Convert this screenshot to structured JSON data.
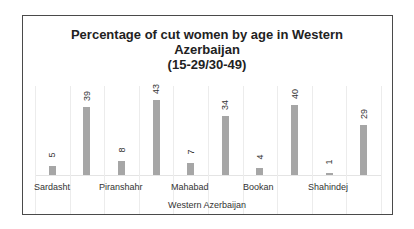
{
  "chart_data": {
    "type": "bar",
    "title": "Percentage of cut women by age in Western Azerbaijan (15-29/30-49)",
    "title_lines": [
      "Percentage of cut women by age in Western",
      "Azerbaijan",
      "(15-29/30-49)"
    ],
    "xlabel": "Western Azerbaijan",
    "ylabel": "",
    "categories": [
      "Sardasht",
      "Piranshahr",
      "Mahabad",
      "Bookan",
      "Shahindej"
    ],
    "series": [
      {
        "name": "15-29",
        "values": [
          5,
          8,
          7,
          4,
          1
        ]
      },
      {
        "name": "30-49",
        "values": [
          39,
          43,
          34,
          40,
          29
        ]
      }
    ],
    "bars_in_order": [
      5,
      39,
      8,
      43,
      7,
      34,
      4,
      40,
      1,
      29
    ],
    "data_labels": [
      "5",
      "39",
      "8",
      "43",
      "7",
      "34",
      "4",
      "40",
      "1",
      "29"
    ],
    "legend": "none",
    "grid": "vertical",
    "bar_color": "#a6a6a6",
    "ylim": [
      0,
      45
    ]
  }
}
